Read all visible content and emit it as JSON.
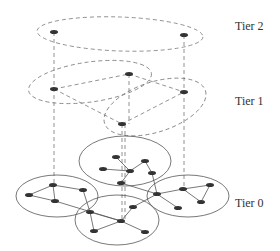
{
  "diagram": {
    "type": "hierarchical-network",
    "tiers": [
      {
        "label": "Tier 2",
        "label_pos": [
          235,
          26
        ],
        "clusters": [
          {
            "cx": 120,
            "cy": 34,
            "rx": 83,
            "ry": 17,
            "rot": 2,
            "dashed": true
          }
        ],
        "nodes": [
          [
            54,
            32
          ],
          [
            184,
            35
          ]
        ],
        "edges": []
      },
      {
        "label": "Tier 1",
        "label_pos": [
          235,
          101
        ],
        "clusters": [
          {
            "cx": 90,
            "cy": 82,
            "rx": 62,
            "ry": 20,
            "rot": -8,
            "dashed": true
          },
          {
            "cx": 155,
            "cy": 107,
            "rx": 53,
            "ry": 25,
            "rot": -18,
            "dashed": true
          }
        ],
        "nodes": [
          [
            54,
            89
          ],
          [
            129,
            74
          ],
          [
            184,
            92
          ],
          [
            122,
            124
          ]
        ],
        "edges": [
          [
            0,
            1
          ],
          [
            0,
            3
          ],
          [
            1,
            2
          ],
          [
            3,
            2
          ]
        ]
      },
      {
        "label": "Tier 0",
        "label_pos": [
          235,
          203
        ],
        "clusters": [
          {
            "cx": 125,
            "cy": 161,
            "rx": 46,
            "ry": 25,
            "rot": 0,
            "dashed": false
          },
          {
            "cx": 57,
            "cy": 196,
            "rx": 41,
            "ry": 21,
            "rot": 0,
            "dashed": false
          },
          {
            "cx": 188,
            "cy": 196,
            "rx": 41,
            "ry": 21,
            "rot": 0,
            "dashed": false
          },
          {
            "cx": 117,
            "cy": 220,
            "rx": 42,
            "ry": 25,
            "rot": 0,
            "dashed": false
          }
        ],
        "nodes": [
          [
            116,
            157
          ],
          [
            145,
            161
          ],
          [
            103,
            169
          ],
          [
            130,
            171
          ],
          [
            152,
            173
          ],
          [
            121,
            183
          ],
          [
            53,
            185
          ],
          [
            83,
            190
          ],
          [
            29,
            195
          ],
          [
            55,
            201
          ],
          [
            183,
            189
          ],
          [
            210,
            185
          ],
          [
            157,
            194
          ],
          [
            201,
            202
          ],
          [
            178,
            208
          ],
          [
            133,
            207
          ],
          [
            90,
            212
          ],
          [
            121,
            221
          ],
          [
            94,
            231
          ],
          [
            145,
            232
          ]
        ],
        "edges": [
          [
            0,
            3
          ],
          [
            2,
            3
          ],
          [
            3,
            1
          ],
          [
            1,
            4
          ],
          [
            3,
            5
          ],
          [
            4,
            12
          ],
          [
            6,
            7
          ],
          [
            6,
            8
          ],
          [
            8,
            9
          ],
          [
            9,
            6
          ],
          [
            7,
            16
          ],
          [
            12,
            10
          ],
          [
            10,
            11
          ],
          [
            11,
            13
          ],
          [
            13,
            10
          ],
          [
            12,
            14
          ],
          [
            12,
            15
          ],
          [
            15,
            17
          ],
          [
            16,
            17
          ],
          [
            16,
            18
          ],
          [
            18,
            17
          ],
          [
            17,
            19
          ],
          [
            9,
            17
          ],
          [
            5,
            12
          ]
        ]
      }
    ],
    "vertical_links": [
      {
        "x": 54,
        "y1": 32,
        "y2": 185
      },
      {
        "x": 184,
        "y1": 35,
        "y2": 189
      },
      {
        "x": 129,
        "y1": 74,
        "y2": 124
      },
      {
        "x": 122,
        "y1": 124,
        "y2": 221
      },
      {
        "x": 125,
        "y1": 124,
        "y2": 221
      }
    ],
    "colors": {
      "node": "#333333",
      "line": "#555555",
      "dashed": "#777777"
    }
  }
}
